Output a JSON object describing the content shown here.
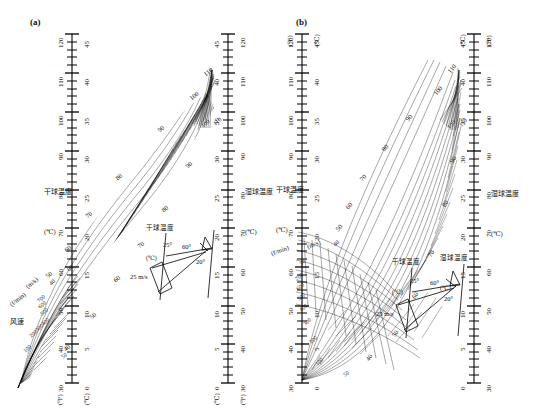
{
  "figure": {
    "type": "nomogram",
    "panels": [
      {
        "id": "a",
        "label": "(a)"
      },
      {
        "id": "b",
        "label": "(b)"
      }
    ]
  },
  "axes": {
    "left": {
      "name_cjk": "干球温度",
      "name_unit_cjk": "(℃)",
      "outer_unit": "(°F)",
      "inner_unit": "(℃)",
      "f_ticks": [
        30,
        40,
        50,
        60,
        70,
        80,
        90,
        100,
        110,
        120
      ],
      "c_ticks": [
        0,
        5,
        10,
        15,
        20,
        25,
        30,
        35,
        40,
        45
      ],
      "f_range": [
        30,
        120
      ],
      "c_range": [
        0,
        45
      ]
    },
    "right": {
      "name_cjk": "湿球温度",
      "name_unit_cjk": "(℃)",
      "outer_unit": "(°F)",
      "inner_unit": "(℃)",
      "f_ticks": [
        30,
        40,
        50,
        60,
        70,
        80,
        90,
        100,
        110,
        120
      ],
      "c_ticks": [
        0,
        5,
        10,
        15,
        20,
        25,
        30,
        35,
        40,
        45
      ],
      "f_range": [
        30,
        120
      ],
      "c_range": [
        0,
        45
      ]
    }
  },
  "windspeed": {
    "label_cjk": "风速",
    "unit_fpm": "(f/min)",
    "unit_ms": "(m/s)",
    "ms_ticks": [
      40,
      60
    ],
    "fpm_ticks": [
      50,
      100,
      200,
      300,
      400,
      500,
      600,
      700
    ],
    "ms_ticks_b": [
      30,
      40
    ],
    "fpm_ticks_b": [
      50,
      100,
      200,
      300,
      400,
      500,
      600,
      700
    ]
  },
  "curve_labels": {
    "upper": [
      50,
      60,
      70,
      80,
      90,
      100,
      110
    ],
    "lower": [
      40,
      50,
      60,
      70,
      80,
      90,
      100,
      110
    ],
    "extra": [
      "100",
      "110"
    ]
  },
  "inset": {
    "left_axis_cjk": "干球温度",
    "left_axis_unit": "(℃)",
    "right_axis_cjk": "湿球温度",
    "right_axis_unit": "(℃)",
    "angles": [
      "25°",
      "60°",
      "20°"
    ],
    "speed": "25 m/s"
  },
  "colors": {
    "ink": "#000000",
    "paper": "#ffffff"
  }
}
